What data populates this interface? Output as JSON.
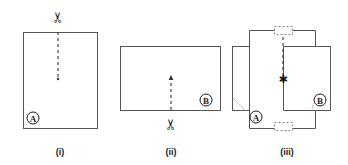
{
  "figure": {
    "background_color": "#ffffff",
    "line_color": "#555555",
    "dash_color": "#333333",
    "ink_color": "#1a1a1a",
    "width": 348,
    "height": 165
  },
  "panels": [
    {
      "id": "i",
      "caption": "(i)",
      "caption_x": 60,
      "caption_y": 152,
      "card": {
        "label": "A",
        "orientation": "portrait",
        "x": 23,
        "y": 32,
        "width": 74,
        "height": 96
      },
      "badge": {
        "letter": "A",
        "cx": 33,
        "cy": 118,
        "r": 6
      },
      "slit": {
        "from_edge": "top",
        "x": 58,
        "y_start": 32,
        "y_end": 79
      },
      "scissors": {
        "glyph": "✂",
        "x": 58,
        "y": 16,
        "rotation": -90
      }
    },
    {
      "id": "ii",
      "caption": "(ii)",
      "caption_x": 171,
      "caption_y": 152,
      "card": {
        "label": "B",
        "orientation": "landscape",
        "x": 120,
        "y": 46,
        "width": 100,
        "height": 64
      },
      "badge": {
        "letter": "B",
        "cx": 206,
        "cy": 100,
        "r": 6
      },
      "slit": {
        "from_edge": "bottom",
        "x": 171,
        "y_start": 110,
        "y_end": 76
      },
      "scissors": {
        "glyph": "✂",
        "x": 171,
        "y": 124,
        "rotation": -90
      }
    },
    {
      "id": "iii",
      "caption": "(iii)",
      "caption_x": 287,
      "caption_y": 152,
      "card_a": {
        "label": "A",
        "orientation": "portrait",
        "x": 249,
        "y": 30,
        "width": 66,
        "height": 98
      },
      "card_b": {
        "label": "B",
        "orientation": "landscape",
        "x": 232,
        "y": 46,
        "width": 98,
        "height": 64
      },
      "badge_a": {
        "letter": "A",
        "cx": 256,
        "cy": 117,
        "r": 6
      },
      "badge_b": {
        "letter": "B",
        "cx": 320,
        "cy": 100,
        "r": 6
      },
      "intersection_marker": {
        "glyph": "✱",
        "x": 283,
        "y": 79
      },
      "slit_line": {
        "x": 283,
        "y_start": 31,
        "y_end": 76
      },
      "notch_top": {
        "x": 274,
        "y": 26,
        "width": 19,
        "height": 9
      },
      "notch_bottom": {
        "x": 274,
        "y": 122,
        "width": 19,
        "height": 9
      }
    }
  ],
  "icons": {
    "scissors": "scissors-icon",
    "star": "star-marker-icon",
    "badge_a": "circled-letter-a-icon",
    "badge_b": "circled-letter-b-icon"
  }
}
